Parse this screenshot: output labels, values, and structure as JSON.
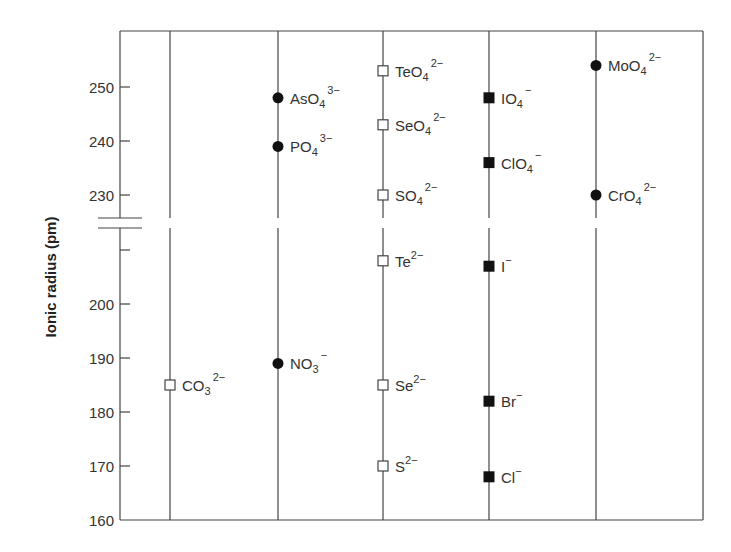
{
  "chart_data": {
    "type": "scatter",
    "title": "",
    "xlabel": "",
    "ylabel": "Ionic radius (pm)",
    "ylim": [
      160,
      260
    ],
    "axis_break": {
      "between": [
        210,
        228
      ]
    },
    "grid": false,
    "yticks_upper": [
      250,
      240,
      230
    ],
    "yticks_lower": [
      200,
      190,
      180,
      170,
      160
    ],
    "yticks_unlabeled": [
      210
    ],
    "marker_legend": {
      "open-square": "group 16 / carbonate anions",
      "filled-circle": "group 15 / 6 oxoanions",
      "filled-square": "halogen anions"
    },
    "columns": [
      {
        "index": 1,
        "points": [
          {
            "ion": "CO3",
            "sub": "3",
            "charge": "2−",
            "base": "CO",
            "value": 185,
            "marker": "open-square"
          }
        ]
      },
      {
        "index": 2,
        "points": [
          {
            "ion": "AsO4",
            "base": "AsO",
            "sub": "4",
            "charge": "3−",
            "value": 248,
            "marker": "filled-circle"
          },
          {
            "ion": "PO4",
            "base": "PO",
            "sub": "4",
            "charge": "3−",
            "value": 239,
            "marker": "filled-circle"
          },
          {
            "ion": "NO3",
            "base": "NO",
            "sub": "3",
            "charge": "−",
            "value": 189,
            "marker": "filled-circle"
          }
        ]
      },
      {
        "index": 3,
        "points": [
          {
            "ion": "TeO4",
            "base": "TeO",
            "sub": "4",
            "charge": "2−",
            "value": 253,
            "marker": "open-square"
          },
          {
            "ion": "SeO4",
            "base": "SeO",
            "sub": "4",
            "charge": "2−",
            "value": 243,
            "marker": "open-square"
          },
          {
            "ion": "SO4",
            "base": "SO",
            "sub": "4",
            "charge": "2−",
            "value": 230,
            "marker": "open-square"
          },
          {
            "ion": "Te",
            "base": "Te",
            "sub": "",
            "charge": "2−",
            "value": 208,
            "marker": "open-square"
          },
          {
            "ion": "Se",
            "base": "Se",
            "sub": "",
            "charge": "2−",
            "value": 185,
            "marker": "open-square"
          },
          {
            "ion": "S",
            "base": "S",
            "sub": "",
            "charge": "2−",
            "value": 170,
            "marker": "open-square"
          }
        ]
      },
      {
        "index": 4,
        "points": [
          {
            "ion": "IO4",
            "base": "IO",
            "sub": "4",
            "charge": "−",
            "value": 248,
            "marker": "filled-square"
          },
          {
            "ion": "ClO4",
            "base": "ClO",
            "sub": "4",
            "charge": "−",
            "value": 236,
            "marker": "filled-square"
          },
          {
            "ion": "I",
            "base": "I",
            "sub": "",
            "charge": "−",
            "value": 207,
            "marker": "filled-square"
          },
          {
            "ion": "Br",
            "base": "Br",
            "sub": "",
            "charge": "−",
            "value": 182,
            "marker": "filled-square"
          },
          {
            "ion": "Cl",
            "base": "Cl",
            "sub": "",
            "charge": "−",
            "value": 168,
            "marker": "filled-square"
          }
        ]
      },
      {
        "index": 5,
        "points": [
          {
            "ion": "MoO4",
            "base": "MoO",
            "sub": "4",
            "charge": "2−",
            "value": 254,
            "marker": "filled-circle"
          },
          {
            "ion": "CrO4",
            "base": "CrO",
            "sub": "4",
            "charge": "2−",
            "value": 230,
            "marker": "filled-circle"
          }
        ]
      }
    ]
  },
  "axis": {
    "y_title": "Ionic radius (pm)",
    "ticks": [
      {
        "label": "250",
        "value": 250
      },
      {
        "label": "240",
        "value": 240
      },
      {
        "label": "230",
        "value": 230
      },
      {
        "label": "",
        "value": 210
      },
      {
        "label": "200",
        "value": 200
      },
      {
        "label": "190",
        "value": 190
      },
      {
        "label": "180",
        "value": 180
      },
      {
        "label": "170",
        "value": 170
      },
      {
        "label": "160",
        "value": 160
      }
    ]
  }
}
